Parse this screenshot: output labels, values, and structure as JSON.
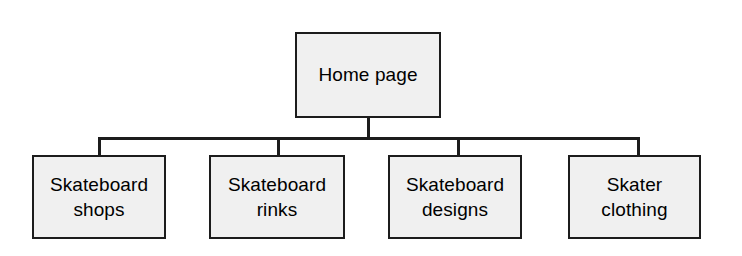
{
  "diagram": {
    "type": "site-map-tree",
    "title": "Home page",
    "root": {
      "label": "Home page",
      "x": 295,
      "y": 32,
      "width": 146,
      "height": 86
    },
    "children": [
      {
        "label": "Skateboard\nshops",
        "line1": "Skateboard",
        "line2": "shops",
        "x": 32,
        "y": 155,
        "width": 134,
        "height": 84
      },
      {
        "label": "Skateboard\nrinks",
        "line1": "Skateboard",
        "line2": "rinks",
        "x": 209,
        "y": 155,
        "width": 136,
        "height": 84
      },
      {
        "label": "Skateboard\ndesigns",
        "line1": "Skateboard",
        "line2": "designs",
        "x": 388,
        "y": 155,
        "width": 134,
        "height": 84
      },
      {
        "label": "Skater\nclothing",
        "line1": "Skater",
        "line2": "clothing",
        "x": 568,
        "y": 155,
        "width": 133,
        "height": 84
      }
    ],
    "connectors": {
      "root_stem": {
        "x": 367,
        "y": 118,
        "length": 19
      },
      "bus": {
        "x": 98,
        "y": 137,
        "length": 540
      },
      "drops": [
        {
          "x": 98,
          "y": 137,
          "length": 18
        },
        {
          "x": 277,
          "y": 137,
          "length": 18
        },
        {
          "x": 457,
          "y": 137,
          "length": 18
        },
        {
          "x": 637,
          "y": 137,
          "length": 18
        }
      ]
    },
    "colors": {
      "box_fill": "#f0f0f0",
      "box_border": "#1c1c1c",
      "line": "#1c1c1c",
      "text": "#000000",
      "background": "#ffffff"
    }
  }
}
